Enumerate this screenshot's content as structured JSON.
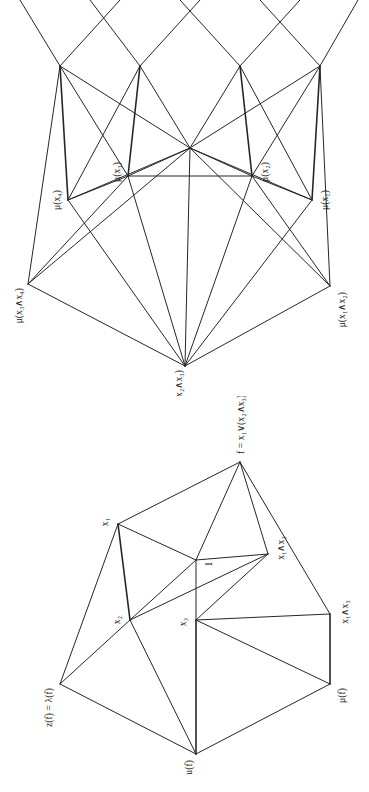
{
  "page": {
    "background_color": "#ffffff",
    "ink_color": "#262626",
    "orientation": "rotated-90-ccw",
    "figure_count": 2
  },
  "figures": [
    {
      "id": "mu-lattice",
      "name": "measure-lattice-diagram",
      "position": "top",
      "type": "hasse-diagram",
      "nodes": [
        {
          "id": "m34",
          "label": "μ(x₃∧x₄)",
          "x": 112,
          "y": 28,
          "anchor": "end",
          "labeled": true
        },
        {
          "id": "m123",
          "label": "μ(x₁∧x₂∧x₃)",
          "x": 30,
          "y": 185,
          "anchor": "end",
          "labeled": true
        },
        {
          "id": "m12",
          "label": "μ(x₁∧x₂)",
          "x": 110,
          "y": 330,
          "anchor": "end",
          "labeled": true
        },
        {
          "id": "m4",
          "label": "μ(x₄)",
          "x": 196,
          "y": 68,
          "anchor": "middle",
          "labeled": true
        },
        {
          "id": "m3",
          "label": "μ(x₃)",
          "x": 220,
          "y": 128,
          "anchor": "middle",
          "labeled": true
        },
        {
          "id": "m2",
          "label": "μ(x₂)",
          "x": 220,
          "y": 252,
          "anchor": "middle",
          "labeled": true
        },
        {
          "id": "m1",
          "label": "μ(x₁)",
          "x": 196,
          "y": 312,
          "anchor": "middle",
          "labeled": true
        },
        {
          "id": "c",
          "label": "",
          "x": 248,
          "y": 190,
          "anchor": "middle",
          "labeled": false
        },
        {
          "id": "r1",
          "label": "",
          "x": 330,
          "y": 60,
          "anchor": "middle",
          "labeled": false
        },
        {
          "id": "r2",
          "label": "",
          "x": 330,
          "y": 140,
          "anchor": "middle",
          "labeled": false
        },
        {
          "id": "r3",
          "label": "",
          "x": 330,
          "y": 240,
          "anchor": "middle",
          "labeled": false
        },
        {
          "id": "r4",
          "label": "",
          "x": 330,
          "y": 320,
          "anchor": "middle",
          "labeled": false
        }
      ]
    },
    {
      "id": "function-lattice",
      "name": "boolean-function-lattice-diagram",
      "position": "bottom",
      "type": "hasse-diagram",
      "nodes": [
        {
          "id": "zf",
          "label": "z(f) = λ(f)",
          "x": 108,
          "y": 60,
          "anchor": "end",
          "labeled": true
        },
        {
          "id": "uf",
          "label": "u(f)",
          "x": 38,
          "y": 196,
          "anchor": "end",
          "labeled": true
        },
        {
          "id": "muf",
          "label": "μ(f)",
          "x": 108,
          "y": 330,
          "anchor": "end",
          "labeled": true
        },
        {
          "id": "x2",
          "label": "x₂",
          "x": 172,
          "y": 130,
          "anchor": "middle",
          "labeled": true
        },
        {
          "id": "x3",
          "label": "x₃",
          "x": 172,
          "y": 196,
          "anchor": "middle",
          "labeled": true
        },
        {
          "id": "one",
          "label": "1",
          "x": 232,
          "y": 196,
          "anchor": "middle",
          "labeled": true
        },
        {
          "id": "x1",
          "label": "x₁",
          "x": 268,
          "y": 118,
          "anchor": "middle",
          "labeled": true
        },
        {
          "id": "x12",
          "label": "x₁∧x₂",
          "x": 238,
          "y": 268,
          "anchor": "middle",
          "labeled": true
        },
        {
          "id": "x13",
          "label": "x₁∧x₃",
          "x": 178,
          "y": 330,
          "anchor": "middle",
          "labeled": true
        },
        {
          "id": "f",
          "label": "f = x₁∨(x₂∧x₃)",
          "x": 330,
          "y": 240,
          "anchor": "start",
          "labeled": true
        }
      ]
    }
  ],
  "labels": {
    "mu_x3_and_x4": "μ(x₃∧x₄)",
    "mu_x1_and_x2_and_x3": "μ(x₁∧x₂∧x₃)",
    "mu_x1_and_x2": "μ(x₁∧x₂)",
    "mu_x4": "μ(x₄)",
    "mu_x3": "μ(x₃)",
    "mu_x2": "μ(x₂)",
    "mu_x1": "μ(x₁)",
    "z_of_f_equals_lambda_of_f": "z(f) = λ(f)",
    "u_of_f": "u(f)",
    "mu_of_f": "μ(f)",
    "x1": "x₁",
    "x2": "x₂",
    "x3": "x₃",
    "one": "1",
    "x1_and_x2": "x₁∧x₂",
    "x1_and_x3": "x₁∧x₃",
    "f_definition": "f = x₁∨(x₂∧x₃)"
  }
}
